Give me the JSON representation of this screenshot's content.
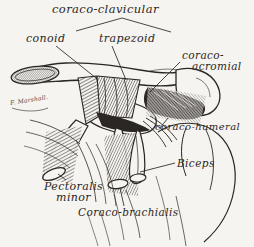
{
  "plate": {
    "background_color": "#f6f4f0",
    "ink_color": "#2b2724",
    "subject": "shoulder-ligaments-dissection",
    "width": 254,
    "height": 247
  },
  "labels": {
    "title": "coraco-clavicular",
    "conoid": "conoid",
    "trapezoid": "trapezoid",
    "coraco_acromial_line1": "coraco-",
    "coraco_acromial_line2": "acromial",
    "coraco_humeral": "coraco-humeral",
    "biceps": "Biceps",
    "pectoralis_line1": "Pectoralis",
    "pectoralis_line2": "minor",
    "coraco_brachialis": "Coraco-brachialis",
    "signature": "F. Marshall.",
    "bone_cut_surface": "clavicle"
  }
}
